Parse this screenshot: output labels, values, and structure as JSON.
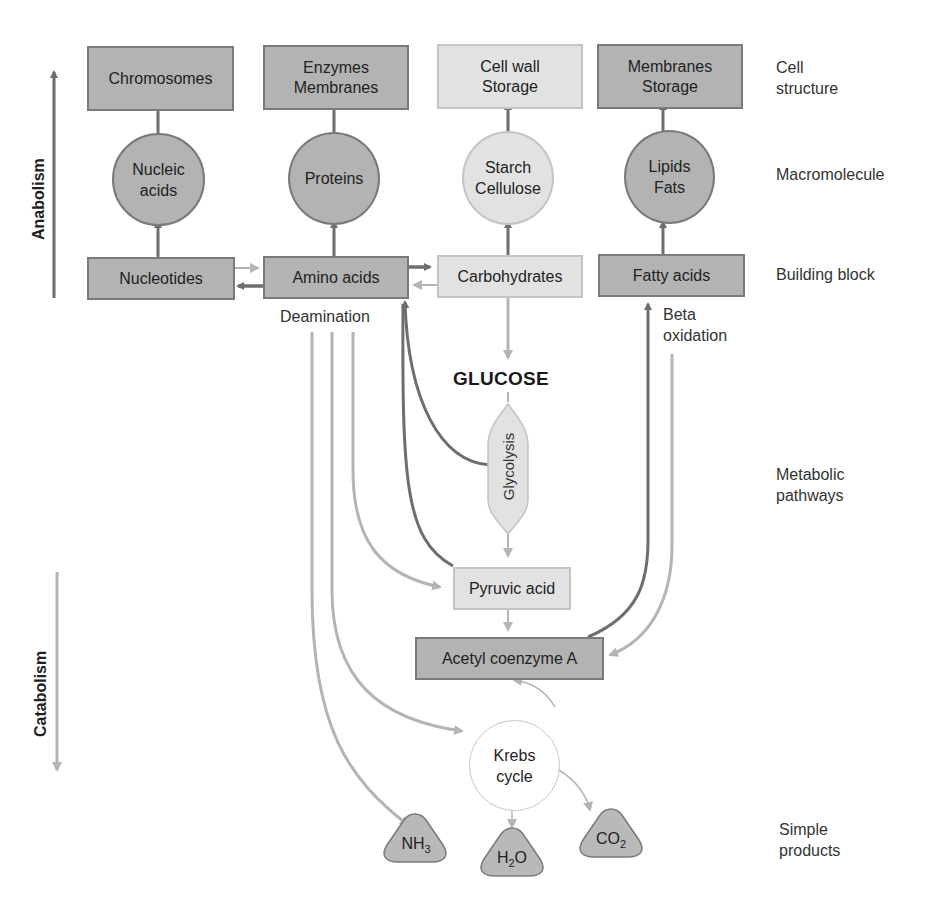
{
  "axis": {
    "anabolism": "Anabolism",
    "catabolism": "Catabolism"
  },
  "levels": {
    "cell_structure": "Cell\nstructure",
    "macromolecule": "Macromolecule",
    "building_block": "Building block",
    "metabolic_pathways": "Metabolic\npathways",
    "simple_products": "Simple\nproducts"
  },
  "cell_structures": [
    {
      "label": "Chromosomes"
    },
    {
      "label": "Enzymes\nMembranes"
    },
    {
      "label": "Cell wall\nStorage"
    },
    {
      "label": "Membranes\nStorage"
    }
  ],
  "macromolecules": [
    {
      "label": "Nucleic\nacids"
    },
    {
      "label": "Proteins"
    },
    {
      "label": "Starch\nCellulose"
    },
    {
      "label": "Lipids\nFats"
    }
  ],
  "building_blocks": [
    {
      "label": "Nucleotides"
    },
    {
      "label": "Amino acids"
    },
    {
      "label": "Carbohydrates"
    },
    {
      "label": "Fatty acids"
    }
  ],
  "pathways": {
    "deamination": "Deamination",
    "beta_oxidation": "Beta\noxidation",
    "glucose": "GLUCOSE",
    "glycolysis": "Glycolysis",
    "pyruvic_acid": "Pyruvic acid",
    "acetyl_coa": "Acetyl coenzyme A",
    "krebs": "Krebs\ncycle"
  },
  "products": {
    "nh3": {
      "base": "NH",
      "sub": "3"
    },
    "h2o": {
      "base": "H",
      "sub": "2",
      "tail": "O"
    },
    "co2": {
      "base": "CO",
      "sub": "2"
    }
  },
  "colors": {
    "dark_fill": "#b3b3b3",
    "light_fill": "#e2e2e2",
    "dark_arrow": "#6e6e6e",
    "light_arrow": "#b4b4b4"
  }
}
